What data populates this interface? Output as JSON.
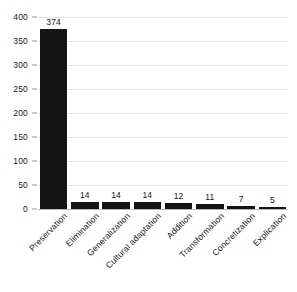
{
  "chart_data": {
    "type": "bar",
    "title": "",
    "subtitle": "",
    "xlabel": "",
    "ylabel": "",
    "categories": [
      "Preservation",
      "Elimination",
      "Generalization",
      "Cultural adaptation",
      "Addition",
      "Transformation",
      "Concretization",
      "Explication"
    ],
    "values": [
      374,
      14,
      14,
      14,
      12,
      11,
      7,
      5
    ],
    "data_labels": [
      "374",
      "14",
      "14",
      "14",
      "12",
      "11",
      "7",
      "5"
    ],
    "ylim": [
      0,
      400
    ],
    "yticks": [
      0,
      50,
      100,
      150,
      200,
      250,
      300,
      350,
      400
    ],
    "ytick_labels": [
      "0",
      "50",
      "100",
      "150",
      "200",
      "250",
      "300",
      "350",
      "400"
    ],
    "grid": true,
    "grid_axis": "y",
    "legend": false,
    "legend_position": "none",
    "bar_color": "#141414",
    "grid_color": "#e3e3e3",
    "axis_color": "#b8b8b8",
    "background_color": "#ffffff",
    "text_color": "#151515"
  }
}
